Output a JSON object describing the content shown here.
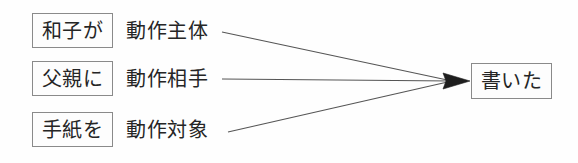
{
  "diagram": {
    "background_color": "#fefefe",
    "line_color": "#555555",
    "box_border_color": "#8a8a8a",
    "text_color": "#252525",
    "rows": [
      {
        "phrase": "和子が",
        "role": "動作主体"
      },
      {
        "phrase": "父親に",
        "role": "動作相手"
      },
      {
        "phrase": "手紙を",
        "role": "動作対象"
      }
    ],
    "predicate": "書いた"
  }
}
